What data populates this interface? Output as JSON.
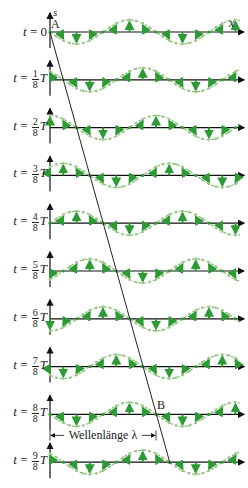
{
  "figure": {
    "axis_labels": {
      "y": "s",
      "x": "x"
    },
    "points": {
      "A": "A",
      "B": "B"
    },
    "wavelength_label": "Wellenlänge λ",
    "colors": {
      "axis": "#111111",
      "wave": "#7fbf6a",
      "arrow": "#2e9a35",
      "dot": "#9ac98c",
      "line": "#222222"
    },
    "rows": [
      {
        "label_t": "t",
        "eq": "=",
        "frac_num": "",
        "frac_den": "",
        "suffix": "0",
        "phase": 0
      },
      {
        "label_t": "t",
        "eq": "=",
        "frac_num": "1",
        "frac_den": "8",
        "suffix": "T",
        "phase": 1
      },
      {
        "label_t": "t",
        "eq": "=",
        "frac_num": "2",
        "frac_den": "8",
        "suffix": "T",
        "phase": 2
      },
      {
        "label_t": "t",
        "eq": "=",
        "frac_num": "3",
        "frac_den": "8",
        "suffix": "T",
        "phase": 3
      },
      {
        "label_t": "t",
        "eq": "=",
        "frac_num": "4",
        "frac_den": "8",
        "suffix": "T",
        "phase": 4
      },
      {
        "label_t": "t",
        "eq": "=",
        "frac_num": "5",
        "frac_den": "8",
        "suffix": "T",
        "phase": 5
      },
      {
        "label_t": "t",
        "eq": "=",
        "frac_num": "6",
        "frac_den": "8",
        "suffix": "T",
        "phase": 6
      },
      {
        "label_t": "t",
        "eq": "=",
        "frac_num": "7",
        "frac_den": "8",
        "suffix": "T",
        "phase": 7
      },
      {
        "label_t": "t",
        "eq": "=",
        "frac_num": "8",
        "frac_den": "8",
        "suffix": "T",
        "phase": 8
      },
      {
        "label_t": "t",
        "eq": "=",
        "frac_num": "9",
        "frac_den": "8",
        "suffix": "T",
        "phase": 9
      }
    ]
  }
}
